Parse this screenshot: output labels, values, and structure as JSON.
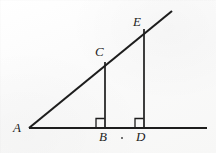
{
  "figure": {
    "background_color": "#fbfbfa",
    "stroke_color": "#1d1d1d",
    "label_color": "#1d1d1d",
    "width": 216,
    "height": 153
  },
  "labels": {
    "A": "A",
    "B": "B",
    "C": "C",
    "D": "D",
    "E": "E"
  },
  "chart_data": {
    "type": "diagram",
    "points": [
      {
        "name": "A",
        "x": 29,
        "y": 128,
        "label": "A",
        "label_x": 13,
        "label_y": 121
      },
      {
        "name": "B",
        "x": 105,
        "y": 128,
        "label": "B",
        "label_x": 99,
        "label_y": 130
      },
      {
        "name": "C",
        "x": 105,
        "y": 62,
        "label": "C",
        "label_x": 95,
        "label_y": 45
      },
      {
        "name": "D",
        "x": 144,
        "y": 128,
        "label": "D",
        "label_x": 136,
        "label_y": 130
      },
      {
        "name": "E",
        "x": 144,
        "y": 29,
        "label": "E",
        "label_x": 133,
        "label_y": 15
      }
    ],
    "segments": [
      {
        "name": "horizontal-baseline",
        "x1": 29,
        "y1": 128,
        "x2": 207,
        "y2": 128,
        "width": 2.1
      },
      {
        "name": "diagonal-ray-AE",
        "x1": 29,
        "y1": 128,
        "x2": 172,
        "y2": 11,
        "width": 2.1
      },
      {
        "name": "vertical-leg-CB",
        "x1": 105,
        "y1": 62,
        "x2": 105,
        "y2": 128,
        "width": 1.7
      },
      {
        "name": "vertical-leg-ED",
        "x1": 144,
        "y1": 29,
        "x2": 144,
        "y2": 128,
        "width": 1.7
      }
    ],
    "right_angle_markers": [
      {
        "name": "right-angle-at-B",
        "vertex_x": 105,
        "vertex_y": 128,
        "size": 9,
        "direction": "left"
      },
      {
        "name": "right-angle-at-D",
        "vertex_x": 144,
        "vertex_y": 128,
        "size": 9,
        "direction": "left"
      }
    ],
    "stray_marks": [
      {
        "name": "ink-dot",
        "x": 122,
        "y": 138,
        "radius": 1
      }
    ],
    "annotations": [],
    "grid": false,
    "legend": false
  }
}
